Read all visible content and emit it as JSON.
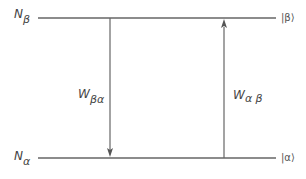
{
  "diagram": {
    "type": "two-level energy diagram",
    "levels": [
      {
        "id": "beta",
        "population_label": "N",
        "population_subscript": "β",
        "ket": "|β⟩",
        "position": "upper"
      },
      {
        "id": "alpha",
        "population_label": "N",
        "population_subscript": "α",
        "ket": "|α⟩",
        "position": "lower"
      }
    ],
    "transitions": [
      {
        "from": "beta",
        "to": "alpha",
        "rate_label": "W",
        "rate_subscript": "βα",
        "direction": "down"
      },
      {
        "from": "alpha",
        "to": "beta",
        "rate_label": "W",
        "rate_subscript": "α β",
        "direction": "up"
      }
    ],
    "colors": {
      "line": "#555555",
      "text": "#444444"
    }
  }
}
